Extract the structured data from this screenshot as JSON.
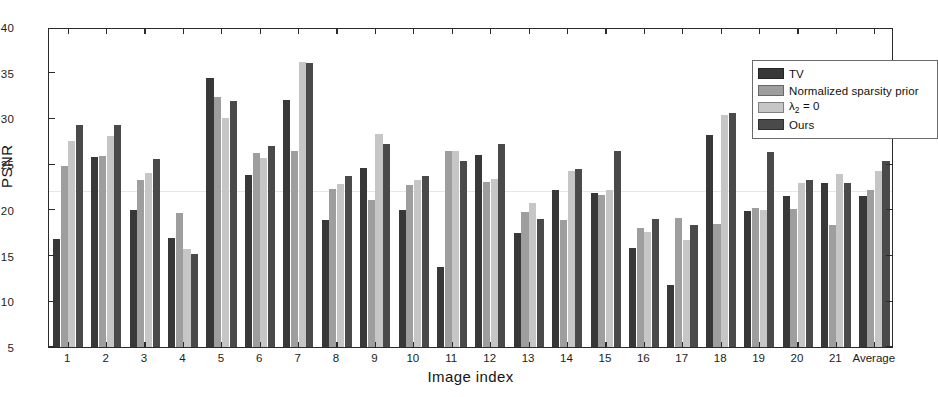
{
  "chart_data": {
    "type": "bar",
    "title": "",
    "xlabel": "Image index",
    "ylabel": "PSNR",
    "ylim": [
      5,
      40
    ],
    "ytick_labels": [
      "5",
      "10",
      "15",
      "20",
      "25",
      "30",
      "35",
      "40"
    ],
    "ytick_values": [
      5,
      10,
      15,
      20,
      25,
      30,
      35,
      40
    ],
    "grid": false,
    "legend_position": "top-right",
    "categories": [
      "1",
      "2",
      "3",
      "4",
      "5",
      "6",
      "7",
      "8",
      "9",
      "10",
      "11",
      "12",
      "13",
      "14",
      "15",
      "16",
      "17",
      "18",
      "19",
      "20",
      "21",
      "Average"
    ],
    "series": [
      {
        "name": "TV",
        "color": "#383838",
        "values": [
          16.8,
          25.8,
          20.0,
          16.9,
          34.4,
          23.8,
          32.0,
          18.9,
          24.6,
          20.0,
          13.8,
          26.0,
          17.5,
          22.2,
          21.9,
          15.8,
          11.8,
          28.2,
          19.9,
          21.5,
          22.9,
          21.5
        ]
      },
      {
        "name": "Normalized sparsity prior",
        "color": "#9e9e9e",
        "values": [
          24.8,
          25.9,
          23.3,
          19.7,
          32.3,
          26.2,
          26.4,
          22.3,
          21.1,
          22.7,
          26.4,
          23.0,
          19.8,
          18.9,
          21.6,
          18.0,
          19.1,
          18.5,
          20.2,
          20.1,
          18.4,
          22.2
        ]
      },
      {
        "name": "lambda2 = 0",
        "label_html": "&lambda;<sub>2</sub> = 0",
        "color": "#c6c6c6",
        "values": [
          27.5,
          28.1,
          24.0,
          15.7,
          30.0,
          25.7,
          36.2,
          22.8,
          28.3,
          23.3,
          26.4,
          23.4,
          20.7,
          24.2,
          22.2,
          17.6,
          16.7,
          30.4,
          20.0,
          22.9,
          23.9,
          24.2
        ]
      },
      {
        "name": "Ours",
        "color": "#4a4a4a",
        "values": [
          29.3,
          29.3,
          25.6,
          15.2,
          31.9,
          27.0,
          36.1,
          23.7,
          27.2,
          23.7,
          25.3,
          27.2,
          19.0,
          24.5,
          26.4,
          19.0,
          18.4,
          30.6,
          26.3,
          23.3,
          22.9,
          25.3
        ]
      }
    ]
  },
  "axes": {
    "ylabel": "PSNR",
    "xlabel": "Image index"
  },
  "legend": {
    "items": [
      {
        "label": "TV",
        "color": "#383838"
      },
      {
        "label": "Normalized sparsity prior",
        "color": "#9e9e9e"
      },
      {
        "label": "λ2 = 0",
        "color": "#c6c6c6"
      },
      {
        "label": "Ours",
        "color": "#4a4a4a"
      }
    ]
  },
  "colors": {
    "axis": "#2b2b2b",
    "background": "#ffffff",
    "series_tv": "#383838",
    "series_nsp": "#9e9e9e",
    "series_lambda": "#c6c6c6",
    "series_ours": "#4a4a4a"
  }
}
